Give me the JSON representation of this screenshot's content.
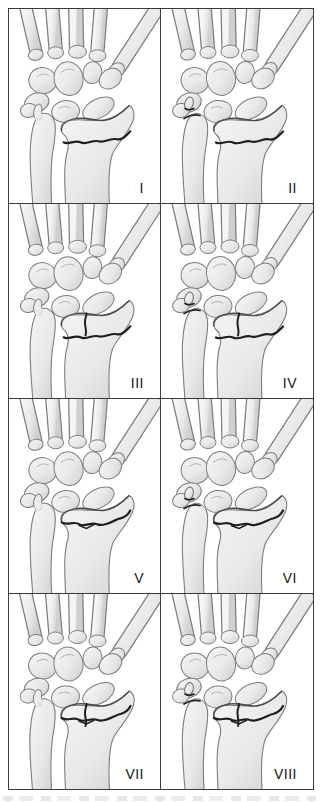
{
  "figure": {
    "name": "wrist-fracture-classification-grid",
    "rows": 4,
    "columns": 2
  },
  "colors": {
    "frame_line": "#3a3a3a",
    "bone_fill_light": "#f3f3f3",
    "bone_fill_mid": "#e7e7e7",
    "bone_fill_dark": "#cfcfcf",
    "bone_outline": "#7d7d7d",
    "bone_edge_dark": "#4a4a4a",
    "fracture_line": "#1f1f1f",
    "label_color": "#151515"
  },
  "panels": [
    {
      "label": "I",
      "features": {
        "transverse_fracture": true,
        "druj_transverse_fracture": false,
        "radiocarpal_split": false,
        "ulnar_styloid_fracture": false,
        "ulnar_styloid_intact": true
      }
    },
    {
      "label": "II",
      "features": {
        "transverse_fracture": true,
        "druj_transverse_fracture": false,
        "radiocarpal_split": false,
        "ulnar_styloid_fracture": true,
        "ulnar_styloid_intact": false
      }
    },
    {
      "label": "III",
      "features": {
        "transverse_fracture": true,
        "druj_transverse_fracture": false,
        "radiocarpal_split": true,
        "ulnar_styloid_fracture": false,
        "ulnar_styloid_intact": true
      }
    },
    {
      "label": "IV",
      "features": {
        "transverse_fracture": true,
        "druj_transverse_fracture": false,
        "radiocarpal_split": true,
        "ulnar_styloid_fracture": true,
        "ulnar_styloid_intact": false
      }
    },
    {
      "label": "V",
      "features": {
        "transverse_fracture": false,
        "druj_transverse_fracture": true,
        "radiocarpal_split": false,
        "ulnar_styloid_fracture": false,
        "ulnar_styloid_intact": true
      }
    },
    {
      "label": "VI",
      "features": {
        "transverse_fracture": false,
        "druj_transverse_fracture": true,
        "radiocarpal_split": false,
        "ulnar_styloid_fracture": true,
        "ulnar_styloid_intact": false
      }
    },
    {
      "label": "VII",
      "features": {
        "transverse_fracture": false,
        "druj_transverse_fracture": true,
        "radiocarpal_split": true,
        "ulnar_styloid_fracture": false,
        "ulnar_styloid_intact": true
      }
    },
    {
      "label": "VIII",
      "features": {
        "transverse_fracture": false,
        "druj_transverse_fracture": true,
        "radiocarpal_split": true,
        "ulnar_styloid_fracture": true,
        "ulnar_styloid_intact": false
      }
    }
  ]
}
